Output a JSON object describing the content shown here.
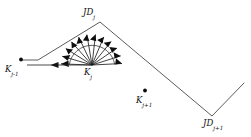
{
  "figure": {
    "type": "geometric-diagram",
    "background_color": "#ffffff",
    "stroke_color": "#3a3a3a",
    "marker_color": "#111111",
    "width": 251,
    "height": 137,
    "nodes": [
      {
        "id": "JD_j",
        "base": "JD",
        "sub": "j",
        "x": 100,
        "y": 22,
        "kind": "vertex",
        "has_marker": false
      },
      {
        "id": "JD_j1",
        "base": "JD",
        "sub": "j+1",
        "x": 212,
        "y": 116,
        "kind": "vertex",
        "has_marker": false
      },
      {
        "id": "K_jm1",
        "base": "K",
        "sub": "j-1",
        "x": 21,
        "y": 60,
        "kind": "point",
        "has_marker": true
      },
      {
        "id": "K_j",
        "base": "K",
        "sub": "j",
        "x": 92,
        "y": 65,
        "kind": "apex",
        "has_marker": false
      },
      {
        "id": "K_j1",
        "base": "K",
        "sub": "j+1",
        "x": 145,
        "y": 91,
        "kind": "point",
        "has_marker": true
      }
    ],
    "polyline_path": [
      {
        "x": 21,
        "y": 60
      },
      {
        "x": 38,
        "y": 60
      },
      {
        "x": 100,
        "y": 22
      },
      {
        "x": 212,
        "y": 116
      },
      {
        "x": 244,
        "y": 83
      }
    ],
    "baseline_arrow": {
      "from_x": 92,
      "from_y": 65,
      "to_x": 27,
      "to_y": 65,
      "head_x": 57,
      "head_y": 65,
      "label": "backward-direction-arrow"
    },
    "fan": {
      "origin_x": 92,
      "origin_y": 65,
      "ray_count": 13,
      "start_angle_deg": 182,
      "end_angle_deg": 358,
      "radius": 31,
      "arc_radius": 23,
      "description": "fan of sampled direction rays with arrowheads"
    },
    "labels": {
      "jd_j": "JD",
      "jd_j_sub": "j",
      "jd_j1": "JD",
      "jd_j1_sub": "j+1",
      "k_jm1": "K",
      "k_jm1_sub": "j-1",
      "k_j": "K",
      "k_j_sub": "j",
      "k_j1": "K",
      "k_j1_sub": "j+1"
    }
  }
}
